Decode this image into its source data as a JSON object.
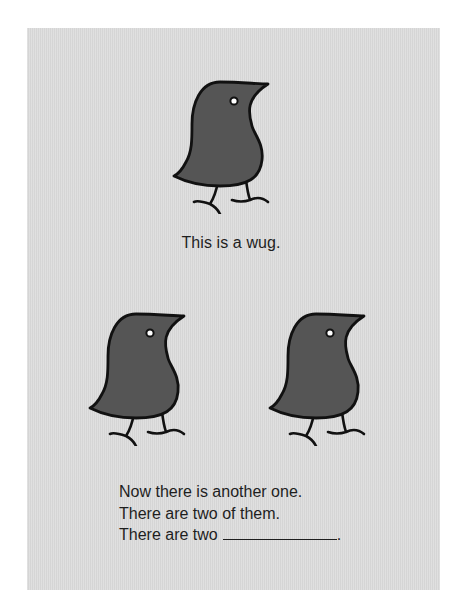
{
  "figure": {
    "card_color": "#dcdcdc",
    "wug_fill": "#555555",
    "wug_outline": "#111111",
    "eye_color": "#ffffff",
    "icons": {
      "wug_single": "wug-bird-icon",
      "wug_pair_left": "wug-bird-icon",
      "wug_pair_right": "wug-bird-icon"
    },
    "caption_single": "This is a wug.",
    "prompt_lines": [
      "Now there is another one.",
      "There are two of them.",
      "There are two"
    ],
    "blank_suffix": ".",
    "wug_count_top": 1,
    "wug_count_bottom": 2
  }
}
